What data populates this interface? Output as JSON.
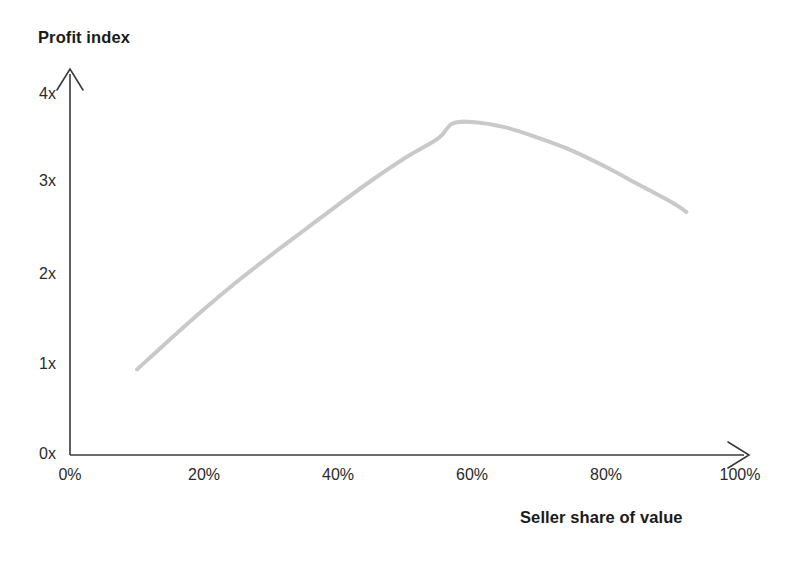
{
  "chart_data": {
    "type": "line",
    "title": "",
    "xlabel": "Seller share of value",
    "ylabel": "Profit index",
    "xlim": [
      0,
      100
    ],
    "ylim": [
      0,
      4.4
    ],
    "grid": false,
    "legend": null,
    "xticks": [
      "0%",
      "20%",
      "40%",
      "60%",
      "80%",
      "100%"
    ],
    "xtick_values": [
      0,
      20,
      40,
      60,
      80,
      100
    ],
    "yticks": [
      "0x",
      "1x",
      "2x",
      "3x",
      "4x"
    ],
    "ytick_values": [
      0,
      1,
      2,
      3,
      4
    ],
    "series": [
      {
        "name": "Profit index",
        "color": "#c9c9c9",
        "x": [
          10,
          15,
          20,
          25,
          30,
          35,
          40,
          45,
          50,
          55,
          57,
          60,
          65,
          70,
          75,
          80,
          85,
          90,
          92
        ],
        "values": [
          0.95,
          1.29,
          1.62,
          1.93,
          2.22,
          2.5,
          2.78,
          3.05,
          3.3,
          3.52,
          3.68,
          3.7,
          3.64,
          3.52,
          3.38,
          3.2,
          3.0,
          2.8,
          2.7
        ]
      }
    ],
    "annotations": [],
    "axis_style": {
      "color": "#3a3a3a",
      "arrow_heads": true,
      "spines": [
        "left",
        "bottom"
      ]
    },
    "curve_color": "#c9c9c9",
    "curve_width": 4
  },
  "axes": {
    "y_title": "Profit index",
    "x_title": "Seller share of value"
  },
  "ticks": {
    "y": [
      {
        "label": "4x",
        "top": 85
      },
      {
        "label": "3x",
        "top": 172
      },
      {
        "label": "2x",
        "top": 265
      },
      {
        "label": "1x",
        "top": 355
      },
      {
        "label": "0x",
        "top": 445
      }
    ],
    "x": [
      {
        "label": "0%",
        "left": 35
      },
      {
        "label": "20%",
        "left": 169
      },
      {
        "label": "40%",
        "left": 303
      },
      {
        "label": "60%",
        "left": 437
      },
      {
        "label": "80%",
        "left": 571
      },
      {
        "label": "100%",
        "left": 705
      }
    ]
  }
}
